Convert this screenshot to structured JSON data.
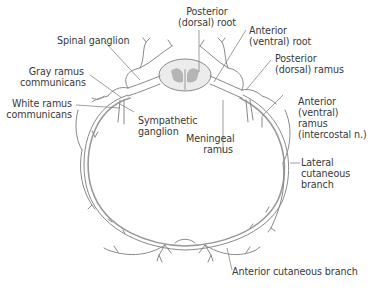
{
  "figure": {
    "labels": {
      "posterior_dorsal_root": "Posterior\n(dorsal) root",
      "anterior_ventral_root": "Anterior\n(ventral) root",
      "spinal_ganglion": "Spinal ganglion",
      "posterior_dorsal_ramus": "Posterior\n(dorsal) ramus",
      "gray_ramus_communicans": "Gray ramus\ncommunicans",
      "white_ramus_communicans": "White ramus\ncommunicans",
      "sympathetic_ganglion": "Sympathetic\nganglion",
      "meningeal_ramus": "Meningeal\nramus",
      "anterior_ventral_ramus": "Anterior\n(ventral)\nramus\n(intercostal n.)",
      "lateral_cutaneous_branch": "Lateral\ncutaneous\nbranch",
      "anterior_cutaneous_branch": "Anterior cutaneous branch"
    },
    "colors": {
      "nerve": "#8a8a8a",
      "label_text": "#3a3a3a",
      "gray_matter": "#b5b5b5",
      "background": "#ffffff"
    }
  }
}
